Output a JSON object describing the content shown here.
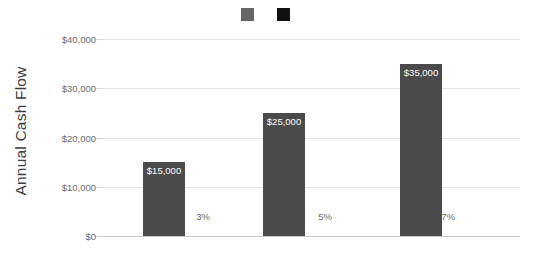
{
  "chart_data": {
    "type": "bar",
    "title": "",
    "xlabel": "",
    "ylabel": "Annual Cash Flow",
    "ylim": [
      0,
      40000
    ],
    "grid": true,
    "legend_position": "top-center",
    "categories": [
      "3%",
      "5%",
      "7%"
    ],
    "values": [
      15000,
      25000,
      35000
    ],
    "value_labels": [
      "$15,000",
      "$25,000",
      "$35,000"
    ],
    "category_labels": [
      "3%",
      "5%",
      "7%"
    ],
    "ytick_values": [
      0,
      10000,
      20000,
      30000,
      40000
    ],
    "ytick_labels": [
      "$0",
      "$10,000",
      "$20,000",
      "$30,000",
      "$40,000"
    ],
    "series": [
      {
        "name": "",
        "values": [
          15000,
          25000,
          35000
        ]
      }
    ],
    "legend_entries": [
      {
        "label": "",
        "color": "#666666"
      },
      {
        "label": "",
        "color": "#111111"
      }
    ],
    "colors": {
      "bar_fill": "#4a4a4a",
      "value_label": "#ffffff",
      "tick_label": "#6b6b6b",
      "axis_title": "#3d3d3d",
      "gridline": "#e3e3e3",
      "baseline": "#c9c9c9",
      "background": "#ffffff"
    }
  }
}
